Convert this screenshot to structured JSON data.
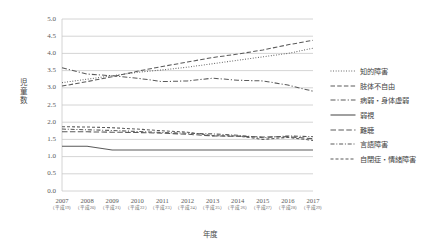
{
  "chart_data": {
    "type": "line",
    "title": "",
    "xlabel": "年度",
    "ylabel": "児童数",
    "ylim": [
      0.0,
      5.0
    ],
    "ystep": 0.5,
    "grid": true,
    "legend_position": "right",
    "categories": [
      "2007",
      "2008",
      "2009",
      "2010",
      "2011",
      "2012",
      "2013",
      "2014",
      "2015",
      "2016",
      "2017"
    ],
    "category_sublabels": [
      "（平成19）",
      "（平成20）",
      "（平成21）",
      "（平成22）",
      "（平成23）",
      "（平成24）",
      "（平成25）",
      "（平成26）",
      "（平成27）",
      "（平成28）",
      "（平成29）"
    ],
    "ytick_labels": [
      "0.0",
      "0.5",
      "1.0",
      "1.5",
      "2.0",
      "2.5",
      "3.0",
      "3.5",
      "4.0",
      "4.5",
      "5.0"
    ],
    "series": [
      {
        "name": "知的障害",
        "dash": "dotted",
        "values": [
          3.15,
          3.25,
          3.35,
          3.45,
          3.52,
          3.6,
          3.7,
          3.8,
          3.9,
          4.0,
          4.15
        ]
      },
      {
        "name": "肢体不自由",
        "dash": "dashed",
        "values": [
          3.05,
          3.18,
          3.32,
          3.48,
          3.62,
          3.75,
          3.88,
          3.98,
          4.1,
          4.25,
          4.38
        ]
      },
      {
        "name": "病弱・身体虚弱",
        "dash": "dashdot",
        "values": [
          3.58,
          3.4,
          3.35,
          3.28,
          3.18,
          3.2,
          3.28,
          3.22,
          3.2,
          3.08,
          2.9
        ]
      },
      {
        "name": "弱視",
        "dash": "solid",
        "values": [
          1.3,
          1.3,
          1.19,
          1.19,
          1.19,
          1.19,
          1.19,
          1.19,
          1.19,
          1.19,
          1.19
        ]
      },
      {
        "name": "難聴",
        "dash": "longdash",
        "values": [
          1.72,
          1.72,
          1.71,
          1.7,
          1.68,
          1.65,
          1.6,
          1.59,
          1.57,
          1.58,
          1.52
        ]
      },
      {
        "name": "言語障害",
        "dash": "dashdot2",
        "values": [
          1.8,
          1.78,
          1.76,
          1.73,
          1.7,
          1.68,
          1.66,
          1.62,
          1.55,
          1.6,
          1.58
        ]
      },
      {
        "name": "自閉症・情緒障害",
        "dash": "shortdash",
        "values": [
          1.87,
          1.86,
          1.84,
          1.8,
          1.75,
          1.71,
          1.61,
          1.6,
          1.5,
          1.56,
          1.47
        ]
      }
    ]
  },
  "colors": {
    "line": "#5a5a5a",
    "grid": "#c9c9c9",
    "text": "#4a4a4a"
  }
}
